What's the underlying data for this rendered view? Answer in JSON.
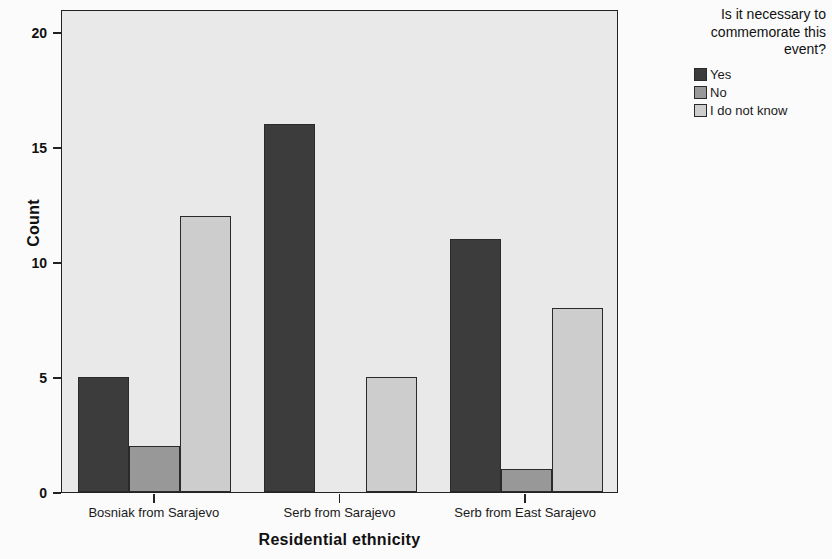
{
  "chart_data": {
    "type": "bar",
    "title": "",
    "xlabel": "Residential ethnicity",
    "ylabel": "Count",
    "categories": [
      "Bosniak from Sarajevo",
      "Serb from Sarajevo",
      "Serb from East Sarajevo"
    ],
    "series": [
      {
        "name": "Yes",
        "color": "#3c3c3c",
        "values": [
          5,
          16,
          11
        ]
      },
      {
        "name": "No",
        "color": "#9a9a9a",
        "values": [
          2,
          0,
          1
        ]
      },
      {
        "name": "I do not know",
        "color": "#cfcfcf",
        "values": [
          12,
          5,
          8
        ]
      }
    ],
    "ylim": [
      0,
      21
    ],
    "yticks": [
      0,
      5,
      10,
      15,
      20
    ],
    "ytick_labels": [
      "0",
      "5",
      "10",
      "15",
      "20"
    ],
    "grid": false,
    "legend_position": "right",
    "legend_title": "Is it necessary to\ncommemorate this\nevent?",
    "plot_background": "#ebebeb",
    "figure_background": "#fdfdfd",
    "axis_color": "#222222"
  },
  "legend": {
    "title": "Is it necessary to\ncommemorate this\nevent?",
    "items": [
      {
        "label": "Yes",
        "color": "#3c3c3c"
      },
      {
        "label": "No",
        "color": "#9a9a9a"
      },
      {
        "label": "I do not know",
        "color": "#cfcfcf"
      }
    ]
  },
  "axes": {
    "y_title": "Count",
    "x_title": "Residential ethnicity",
    "y_tick_labels": [
      "0",
      "5",
      "10",
      "15",
      "20"
    ],
    "x_tick_labels": [
      "Bosniak from Sarajevo",
      "Serb from Sarajevo",
      "Serb from East Sarajevo"
    ]
  }
}
